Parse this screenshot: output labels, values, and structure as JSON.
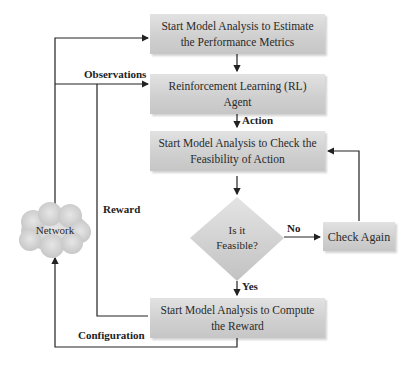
{
  "diagram": {
    "type": "flowchart",
    "nodes": {
      "estimate": {
        "label": "Start Model Analysis to Estimate the Performance Metrics"
      },
      "agent": {
        "label": "Reinforcement Learning (RL) Agent"
      },
      "feasibility": {
        "label": "Start Model Analysis to Check the Feasibility of Action"
      },
      "decision": {
        "line1": "Is it",
        "line2": "Feasible?"
      },
      "check_again": {
        "label": "Check Again"
      },
      "reward": {
        "label": "Start Model Analysis to Compute the Reward"
      },
      "network": {
        "label": "Network"
      }
    },
    "edge_labels": {
      "observations": "Observations",
      "action": "Action",
      "reward": "Reward",
      "no": "No",
      "yes": "Yes",
      "configuration": "Configuration"
    },
    "colors": {
      "box_fill": "#d3d3d3",
      "line": "#222222",
      "background": "#ffffff"
    }
  }
}
